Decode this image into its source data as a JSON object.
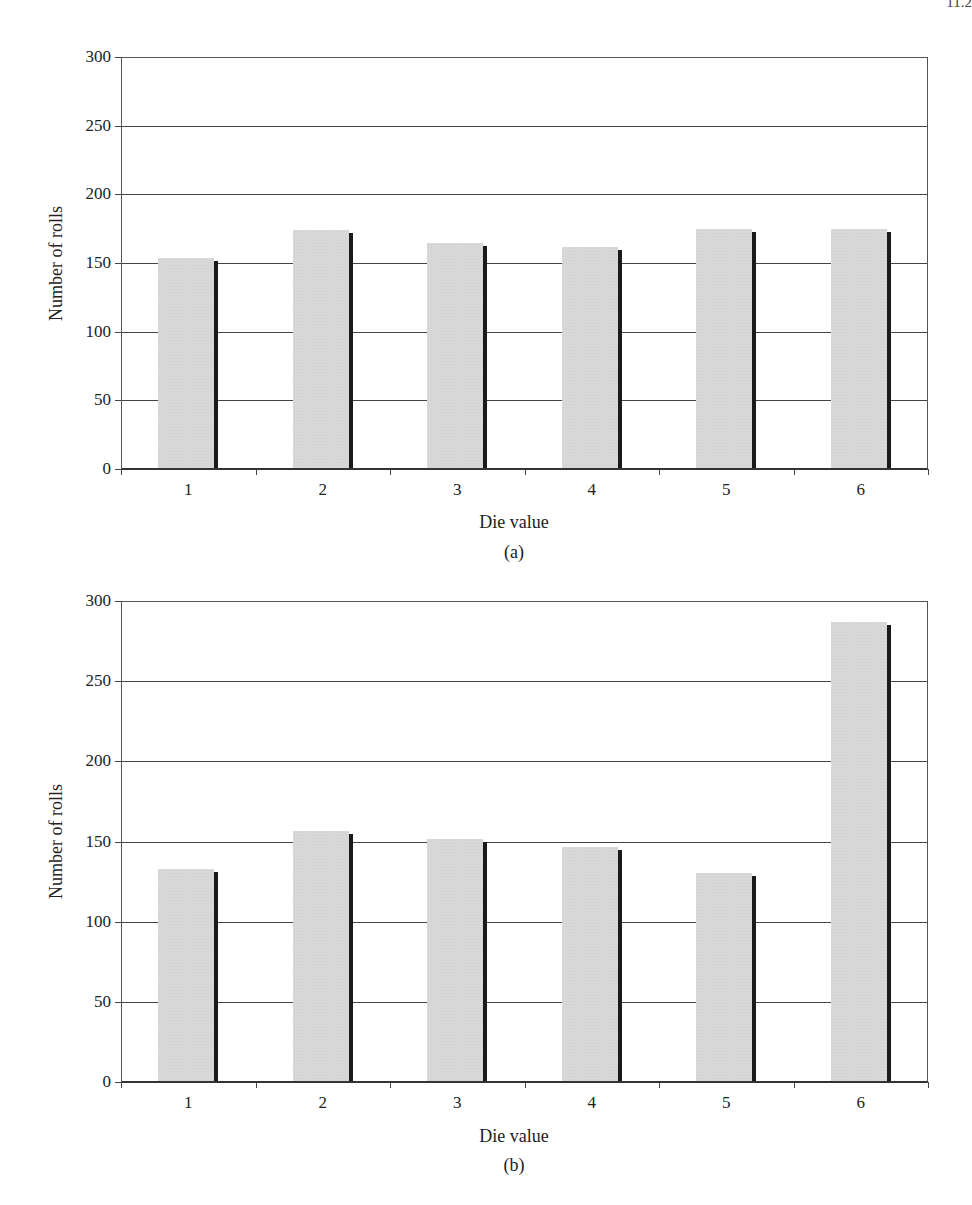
{
  "page_number": "11.2",
  "chart_data": [
    {
      "type": "bar",
      "panel": "(a)",
      "title": "",
      "xlabel": "Die value",
      "ylabel": "Number of rolls",
      "categories": [
        "1",
        "2",
        "3",
        "4",
        "5",
        "6"
      ],
      "values": [
        153,
        173,
        164,
        161,
        174,
        174
      ],
      "ylim": [
        0,
        300
      ],
      "yticks": [
        "0",
        "50",
        "100",
        "150",
        "200",
        "250",
        "300"
      ],
      "grid": true,
      "bar_color": "#d8d8d8",
      "shadow_color": "#1a1a1a"
    },
    {
      "type": "bar",
      "panel": "(b)",
      "title": "",
      "xlabel": "Die value",
      "ylabel": "Number of rolls",
      "categories": [
        "1",
        "2",
        "3",
        "4",
        "5",
        "6"
      ],
      "values": [
        132,
        156,
        151,
        146,
        130,
        286
      ],
      "ylim": [
        0,
        300
      ],
      "yticks": [
        "0",
        "50",
        "100",
        "150",
        "200",
        "250",
        "300"
      ],
      "grid": true,
      "bar_color": "#d8d8d8",
      "shadow_color": "#1a1a1a"
    }
  ]
}
